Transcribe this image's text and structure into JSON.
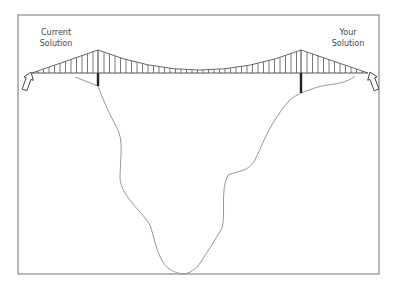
{
  "labels": {
    "left_line1": "Current",
    "left_line2": "Solution",
    "right_line1": "Your",
    "right_line2": "Solution"
  },
  "colors": {
    "frame": "#888888",
    "bridge": "#555555",
    "terrain": "#8a8a8a",
    "pier": "#222222",
    "text": "#444444"
  }
}
